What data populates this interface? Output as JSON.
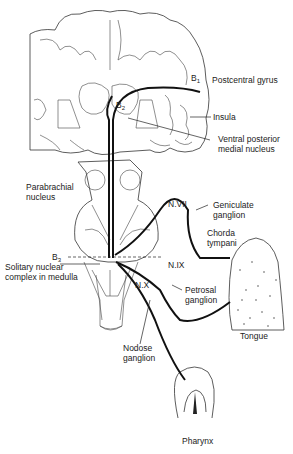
{
  "figure": {
    "labels": {
      "b1": "B",
      "b1_sub": "1",
      "b2": "B",
      "b2_sub": "2",
      "b3": "B",
      "b3_sub": "3",
      "postcentral_gyrus": "Postcentral gyrus",
      "insula": "Insula",
      "vpm_line1": "Ventral posterior",
      "vpm_line2": "medial nucleus",
      "parabrachial_line1": "Parabrachial",
      "parabrachial_line2": "nucleus",
      "geniculate_line1": "Geniculate",
      "geniculate_line2": "ganglion",
      "nvii": "N.VII",
      "chorda_line1": "Chorda",
      "chorda_line2": "tympani",
      "nix": "N.IX",
      "nx": "N.X",
      "solitary_line1": "Solitary nuclear",
      "solitary_line2": "complex in medulla",
      "petrosal_line1": "Petrosal",
      "petrosal_line2": "ganglion",
      "nodose_line1": "Nodose",
      "nodose_line2": "ganglion",
      "tongue": "Tongue",
      "pharynx": "Pharynx"
    }
  }
}
